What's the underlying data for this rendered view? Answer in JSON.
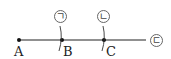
{
  "diagram": {
    "points": [
      {
        "id": "A",
        "label": "A"
      },
      {
        "id": "B",
        "label": "B"
      },
      {
        "id": "C",
        "label": "C"
      }
    ],
    "markers": [
      {
        "id": "giyeok",
        "label": "ㄱ"
      },
      {
        "id": "nieun",
        "label": "ㄴ"
      },
      {
        "id": "digeut",
        "label": "ㄷ"
      }
    ],
    "colors": {
      "line": "#222222"
    }
  }
}
